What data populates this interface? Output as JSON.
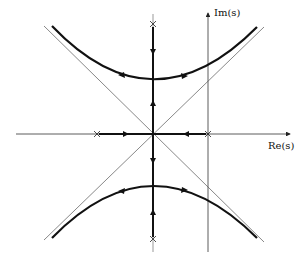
{
  "diagram": {
    "type": "root-locus",
    "axes": {
      "real_label": "Re(s)",
      "imag_label": "Im(s)"
    },
    "poles": [
      {
        "name": "pole-left-real",
        "x": 97,
        "y": 134
      },
      {
        "name": "pole-right-real",
        "x": 208,
        "y": 134
      },
      {
        "name": "pole-upper-imag",
        "x": 153,
        "y": 24
      },
      {
        "name": "pole-lower-imag",
        "x": 153,
        "y": 239
      }
    ],
    "origin": {
      "x": 153,
      "y": 134
    },
    "branches": [
      "real-axis segment from left pole to origin",
      "real-axis segment from right pole to origin",
      "imaginary-axis segment from upper pole to origin",
      "imaginary-axis segment from lower pole to origin",
      "upper hyperbola branch",
      "lower hyperbola branch"
    ],
    "asymptotes": [
      "+45 degrees",
      "-45 degrees"
    ],
    "colors": {
      "locus": "#111111",
      "axis": "#333333",
      "asymptote": "#555555"
    }
  }
}
